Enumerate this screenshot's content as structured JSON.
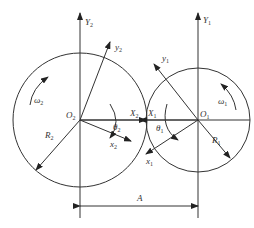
{
  "diagram": {
    "colors": {
      "stroke": "#333333",
      "background": "#ffffff"
    },
    "gear2": {
      "center_label": "O",
      "center_sub": "2",
      "radius_label": "R",
      "radius_sub": "2",
      "omega_label": "ω",
      "omega_sub": "2",
      "fixed_axis_label": "Y",
      "fixed_axis_sub": "2",
      "moving_y_label": "y",
      "moving_y_sub": "2",
      "moving_x_label": "x",
      "moving_x_sub": "2",
      "X_label": "X",
      "X_sub": "2",
      "theta_label": "θ",
      "theta_sub": "2"
    },
    "gear1": {
      "center_label": "O",
      "center_sub": "1",
      "radius_label": "R",
      "radius_sub": "1",
      "omega_label": "ω",
      "omega_sub": "1",
      "fixed_axis_label": "Y",
      "fixed_axis_sub": "1",
      "moving_y_label": "y",
      "moving_y_sub": "1",
      "moving_x_label": "x",
      "moving_x_sub": "1",
      "X_label": "X",
      "X_sub": "1",
      "theta_label": "θ",
      "theta_sub": "1"
    },
    "dimension": {
      "label": "A"
    }
  }
}
